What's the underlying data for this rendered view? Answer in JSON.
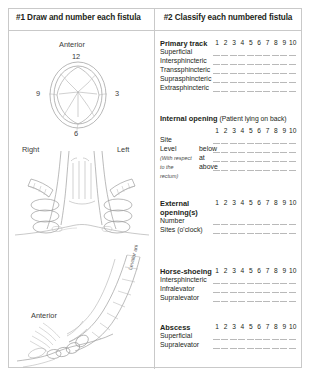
{
  "panels": {
    "left_header": "#1 Draw and number each fistula",
    "right_header": "#2 Classify each numbered fistula"
  },
  "figures": {
    "clock_diagram": {
      "name": "anal-canal-clock-face",
      "anterior_label": "Anterior",
      "marks": {
        "twelve": "12",
        "three": "3",
        "six": "6",
        "nine": "9"
      }
    },
    "coronal_diagram": {
      "name": "coronal-anal-canal",
      "right_label": "Right",
      "left_label": "Left"
    },
    "sagittal_diagram": {
      "name": "sagittal-anal-canal",
      "anterior_label": "Anterior",
      "levator_label": "Levator ani"
    }
  },
  "columns": [
    "1",
    "2",
    "3",
    "4",
    "5",
    "6",
    "7",
    "8",
    "9",
    "10"
  ],
  "blocks": [
    {
      "title": "Primary track",
      "subtitle": "",
      "title_line2": "",
      "rows": [
        {
          "label": "Superficial",
          "mid": ""
        },
        {
          "label": "Intersphincteric",
          "mid": ""
        },
        {
          "label": "Transsphincteric",
          "mid": ""
        },
        {
          "label": "Suprasphincteric",
          "mid": ""
        },
        {
          "label": "Extrasphincteric",
          "mid": ""
        }
      ]
    },
    {
      "title": "Internal opening",
      "subtitle": "(Patient lying on back)",
      "title_line2": "",
      "rows": [
        {
          "label": "Site",
          "mid": ""
        },
        {
          "label": "Level",
          "mid": "below"
        },
        {
          "label": "(With respect",
          "mid": "at",
          "italic": true
        },
        {
          "label": "to the",
          "mid": "above",
          "italic": true
        },
        {
          "label": "rectum)",
          "mid": "",
          "italic": true
        }
      ]
    },
    {
      "title": "External",
      "subtitle": "",
      "title_line2": "opening(s)",
      "rows": [
        {
          "label": "Number",
          "mid": ""
        },
        {
          "label": "Sites (o'clock)",
          "mid": ""
        }
      ]
    },
    {
      "title": "Horse-shoeing",
      "subtitle": "",
      "title_line2": "",
      "rows": [
        {
          "label": "Intersphincteric",
          "mid": ""
        },
        {
          "label": "Infralevator",
          "mid": ""
        },
        {
          "label": "Supralevator",
          "mid": ""
        }
      ]
    },
    {
      "title": "Abscess",
      "subtitle": "",
      "title_line2": "",
      "rows": [
        {
          "label": "Superficial",
          "mid": ""
        },
        {
          "label": "Supralevator",
          "mid": ""
        }
      ]
    }
  ],
  "colors": {
    "ink": "#231f20",
    "rule": "#c9c9c9",
    "answer_line": "#b9b9b9",
    "diagram_stroke": "#8e8e8e"
  }
}
